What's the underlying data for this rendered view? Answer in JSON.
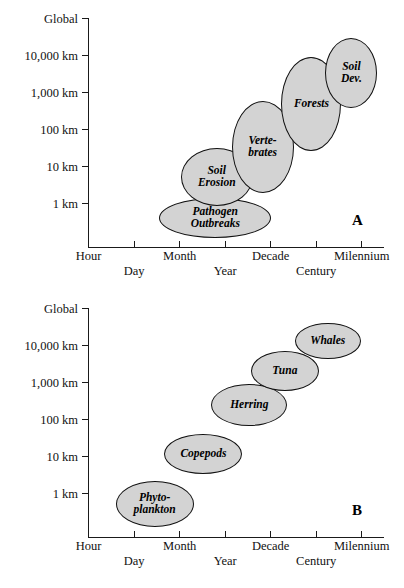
{
  "figure": {
    "panels": [
      {
        "id": "A",
        "letter": "A",
        "letter_pos": {
          "x": 352,
          "y": 212
        },
        "yaxis": {
          "label": "",
          "ticks": [
            "Global",
            "10,000 km",
            "1,000 km",
            "100 km",
            "10 km",
            "1 km"
          ]
        },
        "xaxis": {
          "label": "",
          "ticks": [
            {
              "label": "Hour",
              "row": "top"
            },
            {
              "label": "Day",
              "row": "bottom"
            },
            {
              "label": "Month",
              "row": "top"
            },
            {
              "label": "Year",
              "row": "bottom"
            },
            {
              "label": "Decade",
              "row": "top"
            },
            {
              "label": "Century",
              "row": "bottom"
            },
            {
              "label": "Milennium",
              "row": "top"
            }
          ]
        },
        "bubbles": [
          {
            "name": "Pathogen Outbreaks",
            "label": "Pathogen\nOutbreaks",
            "cx": 43.0,
            "cy": 13.0,
            "w": 112,
            "h": 40,
            "font": 11.5
          },
          {
            "name": "Soil Erosion",
            "label": "Soil\nErosion",
            "cx": 43.5,
            "cy": 31.0,
            "w": 72,
            "h": 58,
            "font": 11.5
          },
          {
            "name": "Vertebrates",
            "label": "Verte-\nbrates",
            "cx": 59.0,
            "cy": 44.0,
            "w": 62,
            "h": 92,
            "font": 11.5
          },
          {
            "name": "Forests",
            "label": "Forests",
            "cx": 75.5,
            "cy": 62.5,
            "w": 60,
            "h": 94,
            "font": 11.5
          },
          {
            "name": "Soil Development",
            "label": "Soil\nDev.",
            "cx": 89.0,
            "cy": 76.0,
            "w": 52,
            "h": 70,
            "font": 11.5
          }
        ]
      },
      {
        "id": "B",
        "letter": "B",
        "letter_pos": {
          "x": 352,
          "y": 212
        },
        "yaxis": {
          "label": "",
          "ticks": [
            "Global",
            "10,000 km",
            "1,000 km",
            "100 km",
            "10 km",
            "1 km"
          ]
        },
        "xaxis": {
          "label": "",
          "ticks": [
            {
              "label": "Hour",
              "row": "top"
            },
            {
              "label": "Day",
              "row": "bottom"
            },
            {
              "label": "Month",
              "row": "top"
            },
            {
              "label": "Year",
              "row": "bottom"
            },
            {
              "label": "Decade",
              "row": "top"
            },
            {
              "label": "Century",
              "row": "bottom"
            },
            {
              "label": "Milennium",
              "row": "top"
            }
          ]
        },
        "bubbles": [
          {
            "name": "Phytoplankton",
            "label": "Phyto-\nplankton",
            "cx": 22.5,
            "cy": 15.0,
            "w": 78,
            "h": 46,
            "font": 11.5
          },
          {
            "name": "Copepods",
            "label": "Copepods",
            "cx": 39.0,
            "cy": 36.5,
            "w": 78,
            "h": 40,
            "font": 11.5
          },
          {
            "name": "Herring",
            "label": "Herring",
            "cx": 54.5,
            "cy": 58.0,
            "w": 76,
            "h": 42,
            "font": 11.5
          },
          {
            "name": "Tuna",
            "label": "Tuna",
            "cx": 66.5,
            "cy": 72.5,
            "w": 68,
            "h": 40,
            "font": 11.5
          },
          {
            "name": "Whales",
            "label": "Whales",
            "cx": 81.0,
            "cy": 85.5,
            "w": 66,
            "h": 36,
            "font": 11.5
          }
        ]
      }
    ]
  },
  "chart_data": {
    "type": "scatter",
    "title": "",
    "subtitle": "",
    "xlabel": "Time scale",
    "ylabel": "Space scale",
    "grid": false,
    "legend": null,
    "x_tick_labels": [
      "Hour",
      "Day",
      "Month",
      "Year",
      "Decade",
      "Century",
      "Milennium"
    ],
    "y_tick_labels": [
      "1 km",
      "10 km",
      "100 km",
      "1,000 km",
      "10,000 km",
      "Global"
    ],
    "panels": [
      {
        "panel": "A",
        "description": "Terrestrial ecological processes plotted on space-time scales",
        "points": [
          {
            "label": "Pathogen Outbreaks",
            "x_category": "Month-Year",
            "y_category": "below 1 km",
            "x_pct": 43.0,
            "y_pct": 13.0,
            "extent_x_pct": 37.8,
            "extent_y_pct": 17.4
          },
          {
            "label": "Soil Erosion",
            "x_category": "Year",
            "y_category": "1-10 km",
            "x_pct": 43.5,
            "y_pct": 31.0,
            "extent_x_pct": 24.3,
            "extent_y_pct": 25.2
          },
          {
            "label": "Vertebrates",
            "x_category": "Year-Decade",
            "y_category": "10-100 km",
            "x_pct": 59.0,
            "y_pct": 44.0,
            "extent_x_pct": 20.9,
            "extent_y_pct": 40.0
          },
          {
            "label": "Forests",
            "x_category": "Decade-Century",
            "y_category": "100-1,000 km",
            "x_pct": 75.5,
            "y_pct": 62.5,
            "extent_x_pct": 20.3,
            "extent_y_pct": 40.9
          },
          {
            "label": "Soil Dev.",
            "x_category": "Century-Milennium",
            "y_category": "1,000-10,000 km",
            "x_pct": 89.0,
            "y_pct": 76.0,
            "extent_x_pct": 17.6,
            "extent_y_pct": 30.4
          }
        ]
      },
      {
        "panel": "B",
        "description": "Marine organisms plotted on space-time scales",
        "points": [
          {
            "label": "Phytoplankton",
            "x_category": "Day",
            "y_category": "1 km",
            "x_pct": 22.5,
            "y_pct": 15.0,
            "extent_x_pct": 26.4,
            "extent_y_pct": 20.0
          },
          {
            "label": "Copepods",
            "x_category": "Month",
            "y_category": "10-100 km",
            "x_pct": 39.0,
            "y_pct": 36.5,
            "extent_x_pct": 26.4,
            "extent_y_pct": 17.4
          },
          {
            "label": "Herring",
            "x_category": "Year",
            "y_category": "1,000 km",
            "x_pct": 54.5,
            "y_pct": 58.0,
            "extent_x_pct": 25.7,
            "extent_y_pct": 18.3
          },
          {
            "label": "Tuna",
            "x_category": "Year-Decade",
            "y_category": "10,000 km",
            "x_pct": 66.5,
            "y_pct": 72.5,
            "extent_x_pct": 23.0,
            "extent_y_pct": 17.4
          },
          {
            "label": "Whales",
            "x_category": "Decade-Century",
            "y_category": "Global",
            "x_pct": 81.0,
            "y_pct": 85.5,
            "extent_x_pct": 22.3,
            "extent_y_pct": 15.7
          }
        ]
      }
    ]
  }
}
